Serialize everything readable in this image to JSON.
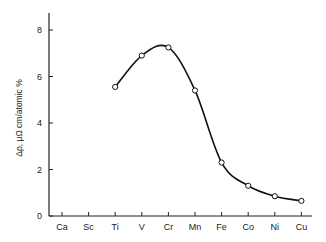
{
  "chart_data": {
    "type": "line",
    "title": "",
    "xlabel": "",
    "ylabel": "Δρ, μΩ cm/atomic %",
    "categories": [
      "Ca",
      "Sc",
      "Ti",
      "V",
      "Cr",
      "Mn",
      "Fe",
      "Co",
      "Ni",
      "Cu"
    ],
    "series": [
      {
        "name": "Δρ",
        "x": [
          "Ti",
          "V",
          "Cr",
          "Mn",
          "Fe",
          "Co",
          "Ni",
          "Cu"
        ],
        "values": [
          5.55,
          6.9,
          7.25,
          5.4,
          2.3,
          1.3,
          0.85,
          0.65
        ],
        "marker": "open-circle",
        "smooth": true
      }
    ],
    "yticks": [
      0,
      2,
      4,
      6,
      8
    ],
    "ylim": [
      0,
      8.7
    ],
    "grid": false,
    "legend": null
  },
  "colors": {
    "line": "#111111",
    "axis": "#222222",
    "marker_fill": "#ffffff"
  }
}
